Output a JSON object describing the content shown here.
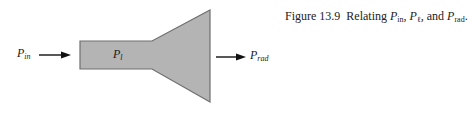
{
  "caption": {
    "figure_number": "Figure 13.9",
    "text_prefix": "Relating ",
    "var1": {
      "base": "P",
      "sub": "in"
    },
    "sep1": ", ",
    "var2": {
      "base": "P",
      "sub": "ℓ"
    },
    "sep2": ", and ",
    "var3": {
      "base": "P",
      "sub": "rad"
    },
    "suffix": "."
  },
  "diagram": {
    "input_label": {
      "base": "P",
      "sub": "in"
    },
    "inner_label": {
      "base": "P",
      "sub": "l"
    },
    "output_label": {
      "base": "P",
      "sub": "rad"
    },
    "fill_color": "#b4b4b4",
    "edge_color": "#6e6e6e",
    "arrow_color": "#111111"
  }
}
